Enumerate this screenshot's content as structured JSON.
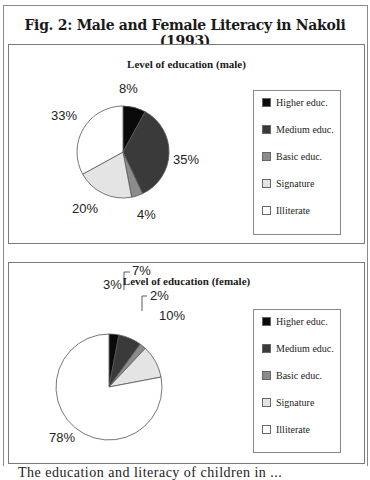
{
  "figure": {
    "title": "Fig. 2:  Male and Female Literacy in Nakoli (1993)",
    "caption_partial": "The education and literacy of children in ..."
  },
  "colors": {
    "higher": "#0a0a0a",
    "medium": "#3a3a3a",
    "basic": "#8c8c8c",
    "signature": "#e4e4e4",
    "illiterate": "#ffffff"
  },
  "legend": {
    "items": [
      {
        "label": "Higher educ.",
        "color": "#0a0a0a"
      },
      {
        "label": "Medium educ.",
        "color": "#3a3a3a"
      },
      {
        "label": "Basic educ.",
        "color": "#8c8c8c"
      },
      {
        "label": "Signature",
        "color": "#e4e4e4"
      },
      {
        "label": "Illiterate",
        "color": "#ffffff"
      }
    ]
  },
  "male": {
    "title": "Level of education (male)",
    "labels": {
      "higher": "8%",
      "medium": "35%",
      "basic": "4%",
      "signature": "20%",
      "illiterate": "33%"
    }
  },
  "female": {
    "title": "Level of education (female)",
    "labels": {
      "higher": "3%",
      "medium": "7%",
      "basic": "2%",
      "signature": "10%",
      "illiterate": "78%"
    }
  },
  "chart_data": [
    {
      "type": "pie",
      "title": "Level of education (male)",
      "categories": [
        "Higher educ.",
        "Medium educ.",
        "Basic educ.",
        "Signature",
        "Illiterate"
      ],
      "values": [
        8,
        35,
        4,
        20,
        33
      ],
      "unit": "%",
      "legend_position": "right"
    },
    {
      "type": "pie",
      "title": "Level of education (female)",
      "categories": [
        "Higher educ.",
        "Medium educ.",
        "Basic educ.",
        "Signature",
        "Illiterate"
      ],
      "values": [
        3,
        7,
        2,
        10,
        78
      ],
      "unit": "%",
      "legend_position": "right"
    }
  ]
}
